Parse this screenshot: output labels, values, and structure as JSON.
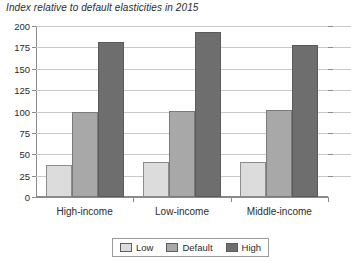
{
  "chart_data": {
    "type": "bar",
    "title": "Index relative to default elasticities in 2015",
    "xlabel": "",
    "ylabel": "",
    "ylim": [
      0,
      200
    ],
    "yticks": [
      0,
      25,
      50,
      75,
      100,
      125,
      150,
      175,
      200
    ],
    "ytick_labels": [
      "0",
      "25",
      "50",
      "75",
      "100",
      "125",
      "150",
      "175",
      "200"
    ],
    "grid": true,
    "legend_position": "bottom-center",
    "categories": [
      "High-income",
      "Low-income",
      "Middle-income"
    ],
    "series": [
      {
        "name": "Low",
        "values": [
          37,
          41,
          41
        ],
        "color": "#dcdcdc"
      },
      {
        "name": "Default",
        "values": [
          100,
          101,
          102
        ],
        "color": "#a8a8a8"
      },
      {
        "name": "High",
        "values": [
          181,
          193,
          178
        ],
        "color": "#6e6e6e"
      }
    ]
  }
}
